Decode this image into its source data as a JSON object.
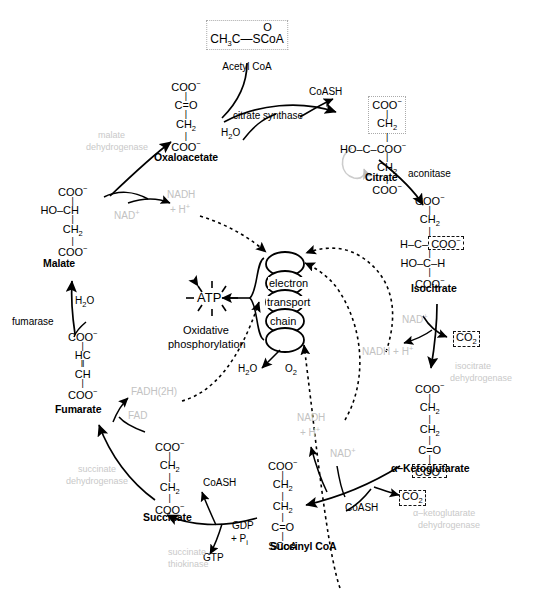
{
  "diagram": {
    "type": "metabolic-pathway"
  },
  "metabolites": {
    "acetyl_coa": {
      "name": "Acetyl CoA",
      "formula_line1": "O",
      "formula_line2": "CH3C—SCoA",
      "boxed": true
    },
    "oxaloacetate": {
      "name": "Oxaloacetate",
      "lines": [
        "COO−",
        "C=O",
        "CH2",
        "COO−"
      ]
    },
    "citrate": {
      "name": "Citrate",
      "lines": [
        "COO−",
        "CH2",
        "HO—C—COO−",
        "CH2",
        "COO−"
      ],
      "boxed_part": "COO− / CH2"
    },
    "isocitrate": {
      "name": "Isocitrate",
      "lines": [
        "COO−",
        "CH2",
        "H—C—COO−",
        "HO—C—H",
        "COO−"
      ],
      "boxed_part": "COO−"
    },
    "alpha_ketoglutarate": {
      "name": "α–Ketoglutarate",
      "lines": [
        "COO−",
        "CH2",
        "CH2",
        "C=O",
        "COO−"
      ],
      "boxed_part": "COO−"
    },
    "succinyl_coa": {
      "name": "Succinyl CoA",
      "lines": [
        "COO−",
        "CH2",
        "CH2",
        "C=O",
        "SCoA"
      ]
    },
    "succinate": {
      "name": "Succinate",
      "lines": [
        "COO−",
        "CH2",
        "CH2",
        "COO−"
      ]
    },
    "fumarate": {
      "name": "Fumarate",
      "lines": [
        "COO−",
        "HC",
        "CH",
        "COO−"
      ]
    },
    "malate": {
      "name": "Malate",
      "lines": [
        "COO−",
        "HO—CH",
        "CH2",
        "COO−"
      ]
    }
  },
  "enzymes": {
    "citrate_synthase": "citrate synthase",
    "aconitase": "aconitase",
    "isocitrate_dehydrogenase_l1": "isocitrate",
    "isocitrate_dehydrogenase_l2": "dehydrogenase",
    "akg_dehydrogenase_l1": "α–ketoglutarate",
    "akg_dehydrogenase_l2": "dehydrogenase",
    "succinate_thiokinase_l1": "succinate",
    "succinate_thiokinase_l2": "thiokinase",
    "succinate_dehydrogenase_l1": "succinate",
    "succinate_dehydrogenase_l2": "dehydrogenase",
    "fumarase": "fumarase",
    "malate_dehydrogenase_l1": "malate",
    "malate_dehydrogenase_l2": "dehydrogenase"
  },
  "cofactors": {
    "coash_top": "CoASH",
    "coash_mid": "CoASH",
    "coash_bottom": "CoASH",
    "water_citrate": "H2O",
    "water_fumarase": "H2O",
    "water_etc": "H2O",
    "oxygen": "O2",
    "nad_malate": "NAD+",
    "nadh_malate_l1": "NADH",
    "nadh_malate_l2": "+ H+",
    "nad_isocitrate": "NAD+",
    "nadh_isocitrate": "NADH + H+",
    "co2_isocitrate": "CO2",
    "nad_akg": "NAD+",
    "nadh_akg_l1": "NADH",
    "nadh_akg_l2": "+ H+",
    "co2_akg": "CO2",
    "fad": "FAD",
    "fadh": "FADH(2H)",
    "gdp_l1": "GDP",
    "gdp_l2": "+ Pi",
    "gtp": "GTP"
  },
  "oxidative_phosphorylation": {
    "atp": "ATP",
    "chain_words": [
      "electron",
      "transport",
      "chain"
    ],
    "caption_l1": "Oxidative",
    "caption_l2": "phosphorylation"
  },
  "colors": {
    "ink": "#000000",
    "enzyme_gray": "#c9c9c9",
    "cofactor_gray": "#c2c2c2",
    "dashed_box": "#111111",
    "dotted_box_gray": "#aaaaaa"
  }
}
